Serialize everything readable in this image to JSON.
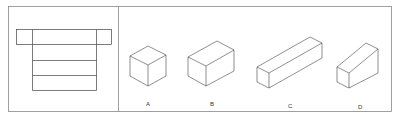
{
  "figure": {
    "question_panel": {
      "description": "unfolded net of a rectangular box"
    },
    "options": [
      {
        "label": "A",
        "shape": "cube"
      },
      {
        "label": "B",
        "shape": "rectangular-box"
      },
      {
        "label": "C",
        "shape": "long-square-prism"
      },
      {
        "label": "D",
        "shape": "wedge"
      }
    ],
    "colors": {
      "stroke": "#444444",
      "frame": "#888888",
      "background": "#ffffff"
    }
  }
}
